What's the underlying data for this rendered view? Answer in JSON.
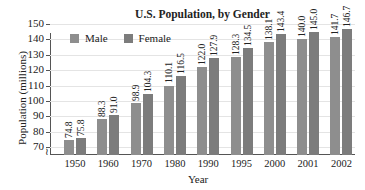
{
  "chart_data": {
    "type": "bar",
    "title": "U.S. Population, by Gender",
    "xlabel": "Year",
    "ylabel": "Population (millions)",
    "categories": [
      "1950",
      "1960",
      "1970",
      "1980",
      "1990",
      "1995",
      "2000",
      "2001",
      "2002"
    ],
    "series": [
      {
        "name": "Male",
        "color": "#8e8e8e",
        "values": [
          74.8,
          88.3,
          98.9,
          110.1,
          122.0,
          128.3,
          138.1,
          140.0,
          141.7
        ]
      },
      {
        "name": "Female",
        "color": "#7c7c7c",
        "values": [
          75.8,
          91.0,
          104.3,
          116.5,
          127.9,
          134.5,
          143.4,
          145.0,
          146.7
        ]
      }
    ],
    "value_labels": {
      "Male": [
        "74.8",
        "88.3",
        "98.9",
        "110.1",
        "122.0",
        "128.3",
        "138.1",
        "140.0",
        "141.7"
      ],
      "Female": [
        "75.8",
        "91.0",
        "104.3",
        "116.5",
        "127.9",
        "134.5",
        "143.4",
        "145.0",
        "146.7"
      ]
    },
    "yticks": [
      "70",
      "80",
      "90",
      "100",
      "110",
      "120",
      "130",
      "140",
      "150"
    ],
    "ylim": [
      65,
      150
    ],
    "axis_break": true,
    "grid": true,
    "legend_position": "top-left inside"
  }
}
